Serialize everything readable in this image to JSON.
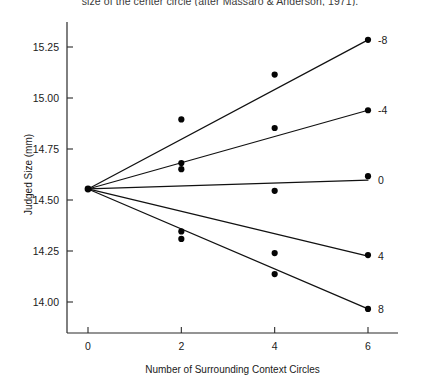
{
  "caption": "size of the center circle (after Massaro & Anderson, 1971).",
  "chart_data": {
    "type": "scatter",
    "title": "",
    "xlabel": "Number of Surrounding Context Circles",
    "ylabel": "Judged Size (mm)",
    "xlim": [
      -0.45,
      6.9
    ],
    "ylim": [
      13.9,
      15.38
    ],
    "xticks": [
      0,
      2,
      4,
      6
    ],
    "xticklabels": [
      "0",
      "2",
      "4",
      "6"
    ],
    "yticks": [
      14.0,
      14.25,
      14.5,
      14.75,
      15.0,
      15.25
    ],
    "yticklabels": [
      "14.00",
      "14.25",
      "14.50",
      "14.75",
      "15.00",
      "15.25"
    ],
    "grid": false,
    "legend_position": "right-of-line-ends",
    "series": [
      {
        "name": "-8",
        "label": "-8",
        "x": [
          0,
          2,
          4,
          6
        ],
        "values": [
          14.554,
          14.895,
          15.115,
          15.285
        ],
        "line_endpoints": [
          [
            0,
            14.554
          ],
          [
            6,
            15.285
          ]
        ]
      },
      {
        "name": "-4",
        "label": "-4",
        "x": [
          0,
          2,
          2,
          4,
          6
        ],
        "values": [
          14.554,
          14.681,
          14.651,
          14.853,
          14.94
        ],
        "line_endpoints": [
          [
            0,
            14.554
          ],
          [
            6,
            14.94
          ]
        ]
      },
      {
        "name": "0",
        "label": "0",
        "x": [
          0,
          4,
          6
        ],
        "values": [
          14.554,
          14.545,
          14.617
        ],
        "line_endpoints": [
          [
            0,
            14.554
          ],
          [
            6,
            14.598
          ]
        ]
      },
      {
        "name": "4",
        "label": "4",
        "x": [
          0,
          2,
          4,
          6
        ],
        "values": [
          14.346,
          14.346,
          14.24,
          14.23
        ],
        "line_endpoints": [
          [
            0,
            14.554
          ],
          [
            6,
            14.225
          ]
        ]
      },
      {
        "name": "8",
        "label": "8",
        "x": [
          0,
          2,
          4,
          6
        ],
        "values": [
          14.554,
          14.309,
          14.137,
          13.966
        ],
        "line_endpoints": [
          [
            0,
            14.554
          ],
          [
            6,
            13.966
          ]
        ]
      }
    ]
  }
}
